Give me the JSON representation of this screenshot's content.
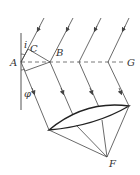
{
  "diagram": {
    "type": "optics-reflection-lens",
    "labels": {
      "A": "A",
      "B": "B",
      "C": "C",
      "G": "G",
      "F": "F",
      "i": "i",
      "phi": "φ"
    },
    "colors": {
      "line": "#444444",
      "background": "#ffffff"
    }
  }
}
